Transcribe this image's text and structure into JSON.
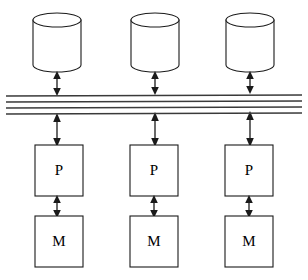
{
  "diagram": {
    "background_color": "#ffffff",
    "stroke_color": "#1a1a1a",
    "bus_color": "#3a3a3a",
    "bus": {
      "name": "system-bus",
      "line_count": 4,
      "lines_y_left": [
        96,
        102,
        108,
        114
      ],
      "lines_y_right": [
        95,
        101,
        107,
        113
      ],
      "x_start": 6,
      "x_end": 302
    },
    "columns": [
      {
        "id": "column-1",
        "disk": {
          "label": "",
          "cx": 57,
          "x": 33,
          "y": 13,
          "width": 48,
          "height": 59,
          "ellipse_ry": 7
        },
        "processor": {
          "label": "P",
          "x": 35,
          "y": 145,
          "width": 48,
          "height": 51
        },
        "memory": {
          "label": "M",
          "x": 35,
          "y": 216,
          "width": 48,
          "height": 51
        }
      },
      {
        "id": "column-2",
        "disk": {
          "label": "",
          "cx": 155,
          "x": 131,
          "y": 13,
          "width": 48,
          "height": 59,
          "ellipse_ry": 7
        },
        "processor": {
          "label": "P",
          "x": 130,
          "y": 145,
          "width": 48,
          "height": 51
        },
        "memory": {
          "label": "M",
          "x": 130,
          "y": 216,
          "width": 48,
          "height": 51
        }
      },
      {
        "id": "column-3",
        "disk": {
          "label": "",
          "cx": 250,
          "x": 226,
          "y": 13,
          "width": 48,
          "height": 59,
          "ellipse_ry": 7
        },
        "processor": {
          "label": "P",
          "x": 225,
          "y": 145,
          "width": 48,
          "height": 51
        },
        "memory": {
          "label": "M",
          "x": 225,
          "y": 216,
          "width": 48,
          "height": 51
        }
      }
    ],
    "connectors": [
      {
        "name": "disk-to-bus",
        "from_y": 72,
        "to_y": 95,
        "double_headed": true
      },
      {
        "name": "bus-to-processor",
        "from_y": 115,
        "to_y": 145,
        "double_headed": true
      },
      {
        "name": "processor-to-memory",
        "from_y": 196,
        "to_y": 216,
        "double_headed": true
      }
    ],
    "legend": {
      "processor_symbol": "P",
      "memory_symbol": "M",
      "storage_symbol": "disk-cylinder"
    }
  }
}
